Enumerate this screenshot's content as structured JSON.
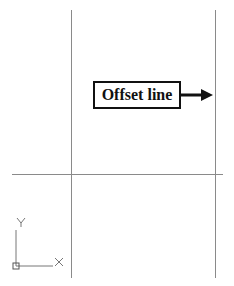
{
  "annotation": {
    "label": "Offset line"
  },
  "ucs_icon": {
    "x_label": "X",
    "y_label": "Y"
  },
  "colors": {
    "line": "#8a8a8a",
    "annotation": "#111111",
    "ucs": "#777777"
  }
}
